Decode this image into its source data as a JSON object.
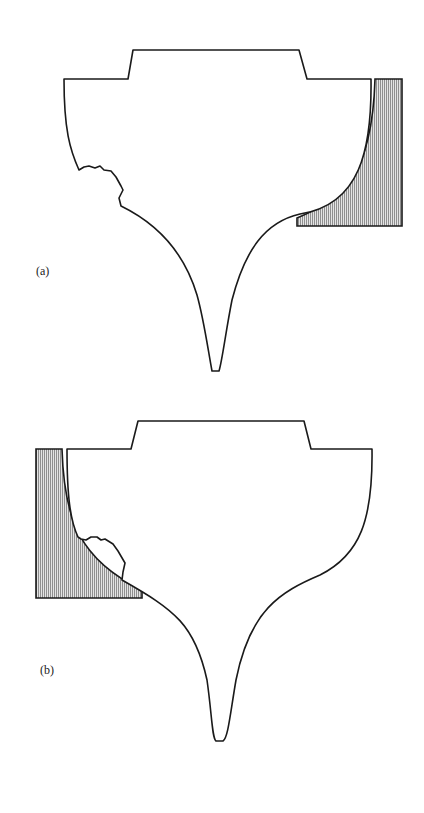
{
  "figures": [
    {
      "id": "a",
      "label": "(a)",
      "hatched_block_side": "right"
    },
    {
      "id": "b",
      "label": "(b)",
      "hatched_block_side": "left"
    }
  ],
  "colors": {
    "stroke": "#1a1a1a",
    "hatch": "#555555",
    "hatch_bg": "#d8d8d8",
    "background": "#ffffff"
  }
}
